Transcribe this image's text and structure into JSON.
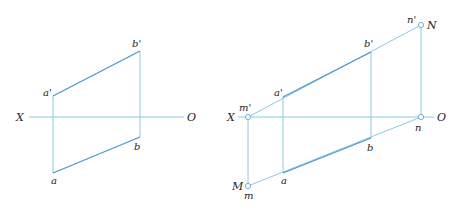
{
  "figure": {
    "colors": {
      "thin_line": "#8ec9e2",
      "thick_line": "#4a97c9",
      "text": "#222222",
      "background": "#ffffff"
    },
    "left": {
      "axis": {
        "x1": 29,
        "x2": 184,
        "y": 117,
        "label_start": "X",
        "label_end": "O"
      },
      "points": {
        "a_prime": {
          "label": "a'",
          "x": 53,
          "y": 96
        },
        "b_prime": {
          "label": "b'",
          "x": 140,
          "y": 51
        },
        "b": {
          "label": "b",
          "x": 140,
          "y": 137
        },
        "a": {
          "label": "a",
          "x": 53,
          "y": 173
        }
      }
    },
    "right": {
      "axis": {
        "x1": 236,
        "x2": 434,
        "y": 117,
        "label_start": "X",
        "label_end": "O"
      },
      "points": {
        "m_prime": {
          "label": "m'",
          "x": 248,
          "y": 117
        },
        "n": {
          "label": "n",
          "x": 421,
          "y": 117
        },
        "n_prime": {
          "label": "n'",
          "x": 421,
          "y": 25
        },
        "N": {
          "label": "N"
        },
        "m": {
          "label": "m",
          "x": 248,
          "y": 186
        },
        "M": {
          "label": "M"
        },
        "a_prime": {
          "label": "a'",
          "x": 283,
          "y": 97
        },
        "b_prime": {
          "label": "b'",
          "x": 371,
          "y": 52
        },
        "b": {
          "label": "b",
          "x": 371,
          "y": 138
        },
        "a": {
          "label": "a",
          "x": 283,
          "y": 173
        }
      }
    }
  }
}
